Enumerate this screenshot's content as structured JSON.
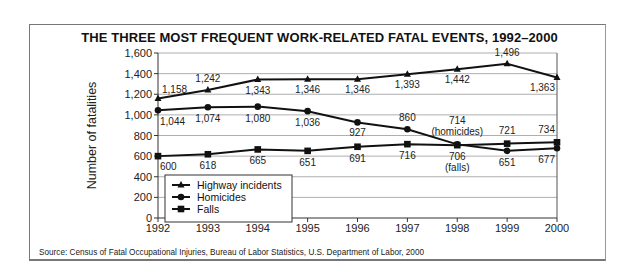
{
  "chart_data": {
    "type": "line",
    "title": "THE THREE MOST FREQUENT WORK-RELATED FATAL EVENTS, 1992–2000",
    "xlabel": "",
    "ylabel": "Number of fatalities",
    "x": [
      "1992",
      "1993",
      "1994",
      "1995",
      "1996",
      "1997",
      "1998",
      "1999",
      "2000"
    ],
    "ylim": [
      0,
      1600
    ],
    "yticks": [
      0,
      200,
      400,
      600,
      800,
      1000,
      1200,
      1400,
      1600
    ],
    "ytick_labels": [
      "0",
      "200",
      "400",
      "600",
      "800",
      "1,000",
      "1,200",
      "1,400",
      "1,600"
    ],
    "grid": true,
    "legend_position": "lower-left inside plot",
    "series": [
      {
        "name": "Highway incidents",
        "marker": "triangle",
        "values": [
          1158,
          1242,
          1343,
          1346,
          1346,
          1393,
          1442,
          1496,
          1363
        ],
        "labels": [
          "1,158",
          "1,242",
          "1,343",
          "1,346",
          "1,346",
          "1,393",
          "1,442",
          "1,496",
          "1,363"
        ]
      },
      {
        "name": "Homicides",
        "marker": "circle",
        "values": [
          1044,
          1074,
          1080,
          1036,
          927,
          860,
          714,
          651,
          677
        ],
        "labels": [
          "1,044",
          "1,074",
          "1,080",
          "1,036",
          "927",
          "860",
          "714",
          "651",
          "677"
        ]
      },
      {
        "name": "Falls",
        "marker": "square",
        "values": [
          600,
          618,
          665,
          651,
          691,
          716,
          706,
          721,
          734
        ],
        "labels": [
          "600",
          "618",
          "665",
          "651",
          "691",
          "716",
          "706",
          "721",
          "734"
        ]
      }
    ],
    "annotations": [
      {
        "text": "(homicides)",
        "x": "1998",
        "series": "Homicides"
      },
      {
        "text": "(falls)",
        "x": "1998",
        "series": "Falls"
      }
    ],
    "source": "Source: Census of Fatal Occupational Injuries,  Bureau of Labor Statistics, U.S. Department of Labor,  2000"
  }
}
